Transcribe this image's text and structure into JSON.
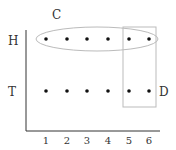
{
  "diagram": {
    "labels": {
      "event_c": "C",
      "event_d": "D",
      "row_h": "H",
      "row_t": "T"
    },
    "x_ticks": [
      "1",
      "2",
      "3",
      "4",
      "5",
      "6"
    ],
    "rows": [
      "H",
      "T"
    ],
    "colors": {
      "axis": "#333333",
      "dot": "#111111",
      "outline": "#bbbbbb",
      "text": "#333333"
    }
  }
}
